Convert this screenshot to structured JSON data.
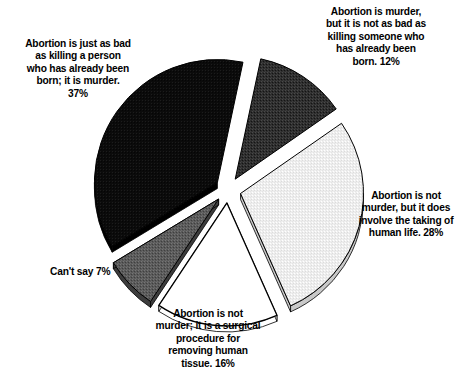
{
  "chart_data": {
    "type": "pie",
    "title": "",
    "subtitle": "",
    "xlabel": "",
    "ylabel": "",
    "legend_position": "callout-labels",
    "exploded": true,
    "style": "3d-exploded-grayscale",
    "categories": [
      "Abortion is murder, but it is not as bad as killing someone who has already been born.",
      "Abortion is not murder, but it does involve the taking of human life.",
      "Abortion is not murder; it is a surgical procedure for removing human tissue.",
      "Can't say",
      "Abortion is just as bad as killing a person who has already been born; it is murder."
    ],
    "values": [
      12,
      28,
      16,
      7,
      37
    ],
    "value_labels": [
      "12%",
      "28%",
      "16%",
      "7%",
      "37%"
    ],
    "units": "percent",
    "total": 100,
    "slices": [
      {
        "label": "Abortion is murder, but it is not as bad as killing someone who has already been born.",
        "value": 12,
        "value_label": "12%",
        "fill": "#333333",
        "edge": "#1a1a1a",
        "texture": "dark-stipple",
        "position": "top-right"
      },
      {
        "label": "Abortion is not murder, but it does involve the taking of human life.",
        "value": 28,
        "value_label": "28%",
        "fill": "#ededed",
        "edge": "#c9c9c9",
        "texture": "light-stipple",
        "position": "right"
      },
      {
        "label": "Abortion is not murder; it is a surgical procedure for removing human tissue.",
        "value": 16,
        "value_label": "16%",
        "fill": "#ffffff",
        "edge": "#ffffff",
        "texture": "none",
        "position": "bottom"
      },
      {
        "label": "Can't say",
        "value": 7,
        "value_label": "7%",
        "fill": "#5e5e5e",
        "edge": "#3d3d3d",
        "texture": "mid-stipple",
        "position": "bottom-left"
      },
      {
        "label": "Abortion is just as bad as killing a person who has already been born; it is murder.",
        "value": 37,
        "value_label": "37%",
        "fill": "#0d0d0d",
        "edge": "#000000",
        "texture": "solid-black",
        "position": "left"
      }
    ]
  },
  "callouts": {
    "top_left": "Abortion is just as bad\nas killing a person\nwho has already been\nborn; it is murder.\n37%",
    "top_right": "Abortion is murder,\nbut it is not as bad as\nkilling someone who\nhas already been\nborn.  12%",
    "right": "Abortion is not\nmurder, but it does\ninvolve the taking of\nhuman life.  28%",
    "bottom": "Abortion is not\nmurder; it is a surgical\nprocedure for\nremoving human\ntissue.  16%",
    "left": "Can't say  7%"
  },
  "colors": {
    "background": "#ffffff",
    "text": "#000000",
    "slice_black": "#0d0d0d",
    "slice_dark_gray": "#333333",
    "slice_mid_gray": "#5e5e5e",
    "slice_light_gray": "#ededed",
    "slice_white": "#ffffff",
    "outline": "#000000"
  }
}
